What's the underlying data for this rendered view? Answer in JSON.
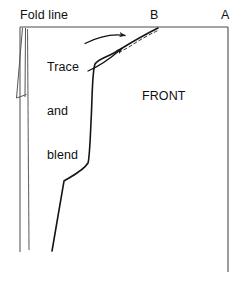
{
  "diagram": {
    "kind": "line-drawing",
    "width": 248,
    "height": 284,
    "background_color": "#ffffff",
    "line_color": "#1a1a1a",
    "labels": {
      "fold_line": "Fold line",
      "point_b": "B",
      "point_a": "A",
      "instruction": "Trace\nand\nblend",
      "instruction_line_1": "Trace",
      "instruction_line_2": "and",
      "instruction_line_3": "blend",
      "piece_name": "FRONT"
    },
    "shapes": [
      {
        "name": "top-edge",
        "type": "line",
        "description": "Horizontal top edge from fold line to point A",
        "from": [
          20,
          27
        ],
        "to": [
          228,
          27
        ]
      },
      {
        "name": "fold-line-edge",
        "type": "line",
        "description": "Vertical fold line at left running full height",
        "from": [
          20,
          27
        ],
        "to": [
          20,
          252
        ]
      },
      {
        "name": "right-edge",
        "type": "line",
        "description": "Vertical right edge below point A",
        "from": [
          228,
          27
        ],
        "to": [
          228,
          272
        ]
      },
      {
        "name": "dart-leg-left",
        "type": "line",
        "description": "Left leg of narrow dart near fold",
        "from": [
          22,
          28
        ],
        "to": [
          17,
          98
        ]
      },
      {
        "name": "dart-leg-right",
        "type": "line",
        "description": "Right leg of narrow dart near fold",
        "from": [
          25,
          28
        ],
        "to": [
          26,
          98
        ]
      },
      {
        "name": "dart-base",
        "type": "line",
        "description": "Short closing stroke at dart point",
        "from": [
          17,
          98
        ],
        "to": [
          27,
          95
        ]
      },
      {
        "name": "inner-vertical-edge",
        "type": "line",
        "description": "Second vertical guideline just right of fold",
        "from": [
          27,
          30
        ],
        "to": [
          29,
          250
        ]
      },
      {
        "name": "armhole-curve",
        "type": "curve",
        "description": "Traced and blended armhole/side seam curve from point B down to hem",
        "points": [
          [
            158,
            28
          ],
          [
            128,
            44
          ],
          [
            105,
            58
          ],
          [
            95,
            63
          ],
          [
            92,
            90
          ],
          [
            90,
            130
          ],
          [
            88,
            162
          ],
          [
            78,
            173
          ],
          [
            64,
            181
          ],
          [
            58,
            215
          ],
          [
            52,
            251
          ]
        ]
      },
      {
        "name": "blend-dashed-curve",
        "type": "dashed-curve",
        "description": "Original dashed cutting line being blended near point B",
        "points": [
          [
            157,
            30
          ],
          [
            140,
            38
          ],
          [
            128,
            45
          ],
          [
            120,
            50
          ]
        ]
      },
      {
        "name": "pointer-arrow",
        "type": "arrow",
        "description": "Curved arrow from the word Trace to the armhole curve",
        "points": [
          [
            85,
            43
          ],
          [
            104,
            36
          ],
          [
            120,
            34
          ],
          [
            132,
            37
          ]
        ],
        "head_at": [
          132,
          37
        ]
      },
      {
        "name": "pointer-arrow-lower",
        "type": "arrow",
        "description": "Curved arrow from the word blend up to the curve near point B",
        "points": [
          [
            88,
            70
          ],
          [
            104,
            62
          ],
          [
            118,
            52
          ],
          [
            130,
            44
          ]
        ],
        "head_at": [
          130,
          44
        ]
      }
    ]
  }
}
